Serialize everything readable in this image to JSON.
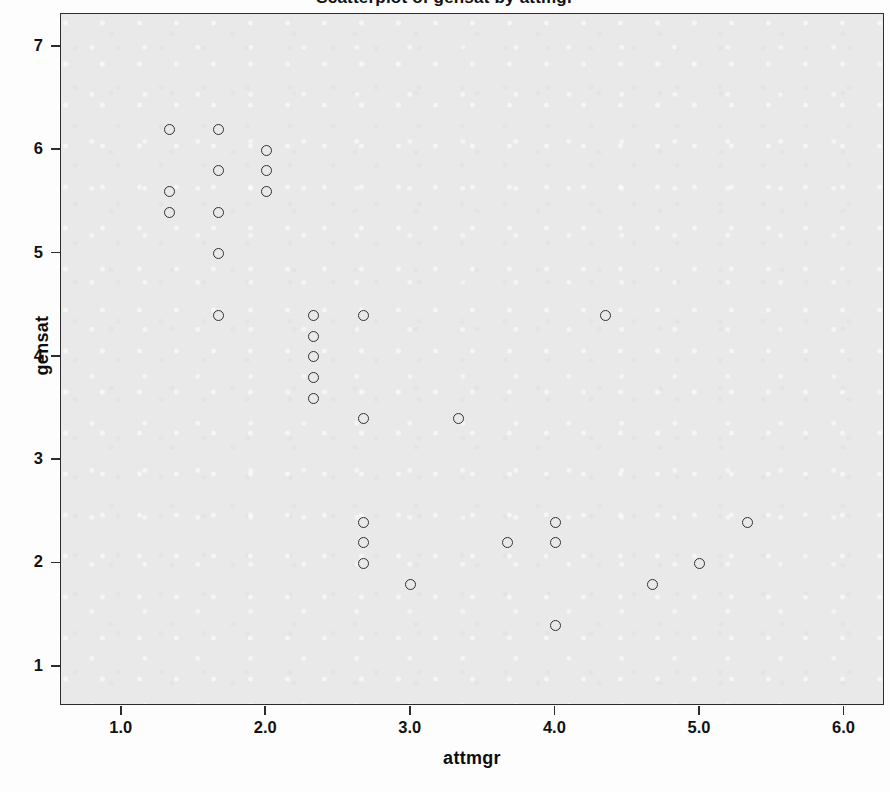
{
  "chart_data": {
    "type": "scatter",
    "title": "Scatterplot of gensat by attmgr",
    "xlabel": "attmgr",
    "ylabel": "gensat",
    "xlim": [
      0.58,
      6.28
    ],
    "ylim": [
      0.62,
      7.32
    ],
    "xticks": [
      "1.0",
      "2.0",
      "3.0",
      "4.0",
      "5.0",
      "6.0"
    ],
    "xtick_values": [
      1.0,
      2.0,
      3.0,
      4.0,
      5.0,
      6.0
    ],
    "yticks": [
      "1",
      "2",
      "3",
      "4",
      "5",
      "6",
      "7"
    ],
    "ytick_values": [
      1,
      2,
      3,
      4,
      5,
      6,
      7
    ],
    "grid": false,
    "legend": "none",
    "marker": "open-circle",
    "marker_color": "#303036",
    "plot_background": "#e9e9e9",
    "n_points": 31,
    "points": [
      {
        "x": 1.33,
        "y": 6.2
      },
      {
        "x": 1.33,
        "y": 5.6
      },
      {
        "x": 1.33,
        "y": 5.4
      },
      {
        "x": 1.67,
        "y": 6.2
      },
      {
        "x": 1.67,
        "y": 5.8
      },
      {
        "x": 1.67,
        "y": 5.4
      },
      {
        "x": 1.67,
        "y": 5.0
      },
      {
        "x": 1.67,
        "y": 4.4
      },
      {
        "x": 2.0,
        "y": 6.0
      },
      {
        "x": 2.0,
        "y": 5.8
      },
      {
        "x": 2.0,
        "y": 5.6
      },
      {
        "x": 2.33,
        "y": 4.4
      },
      {
        "x": 2.33,
        "y": 4.2
      },
      {
        "x": 2.33,
        "y": 4.0
      },
      {
        "x": 2.33,
        "y": 3.8
      },
      {
        "x": 2.33,
        "y": 3.6
      },
      {
        "x": 2.67,
        "y": 4.4
      },
      {
        "x": 2.67,
        "y": 3.4
      },
      {
        "x": 2.67,
        "y": 2.4
      },
      {
        "x": 2.67,
        "y": 2.2
      },
      {
        "x": 2.67,
        "y": 2.0
      },
      {
        "x": 3.0,
        "y": 1.8
      },
      {
        "x": 3.33,
        "y": 3.4
      },
      {
        "x": 3.67,
        "y": 2.2
      },
      {
        "x": 4.0,
        "y": 2.4
      },
      {
        "x": 4.0,
        "y": 2.2
      },
      {
        "x": 4.0,
        "y": 1.4
      },
      {
        "x": 4.35,
        "y": 4.4
      },
      {
        "x": 4.67,
        "y": 1.8
      },
      {
        "x": 5.0,
        "y": 2.0
      },
      {
        "x": 5.33,
        "y": 2.4
      }
    ]
  },
  "background_bleed": {
    "text": "and the work that is carried out in the various areas of the organisation, and the way in which it is supported by the management team. The aim is also to consider the degree to which the staff who were interviewed for this study, and who took part in the survey, regard the present arrangements as satisfactory and whether there are particular issues which should be addressed in the near future by the senior management group. In the second part of the chapter, the responses of the managers themselves are reviewed and compared with those of the staff as a whole. It should be noted that only about one third of the managers who were approached agreed to be interviewed, and that the comments of those who did take part cannot therefore be taken as representative of the whole group. Nevertheless, the results reported below do suggest that certain themes recur with sufficient regularity to warrant further investigation. The remainder of the chapter is organised as follows: the first section describes the sample, the second presents the main findings, and the third considers the implications for practice.\n\n4.2  Staff satisfaction"
  }
}
